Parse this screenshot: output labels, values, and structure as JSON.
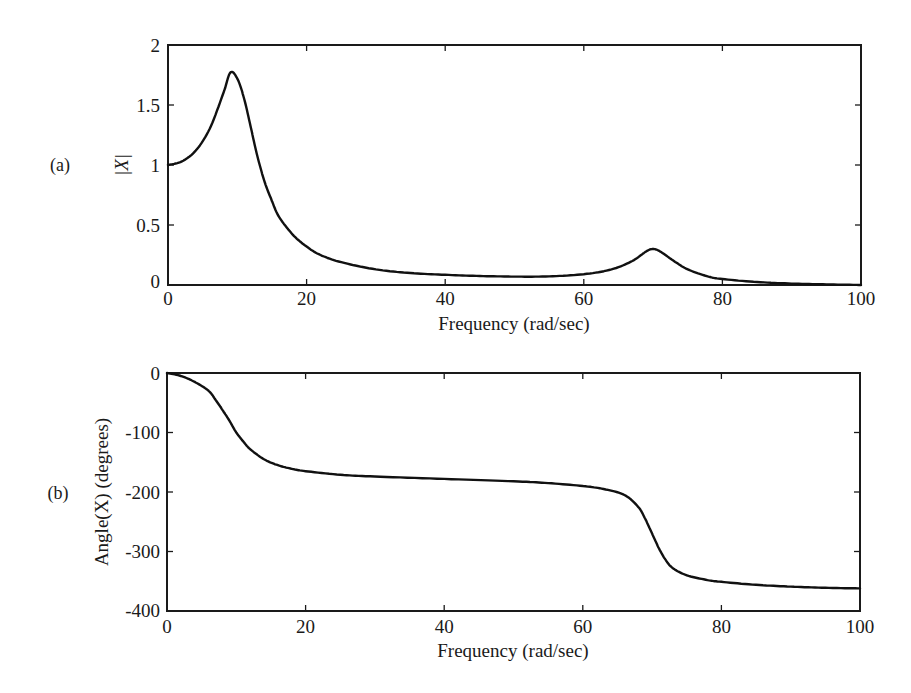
{
  "figure": {
    "panels": [
      {
        "id": "a",
        "panel_label": "(a)",
        "xlabel": "Frequency (rad/sec)",
        "ylabel": "|X|",
        "xticks": [
          "0",
          "20",
          "40",
          "60",
          "80",
          "100"
        ],
        "yticks": [
          "0",
          "0.5",
          "1",
          "1.5",
          "2"
        ]
      },
      {
        "id": "b",
        "panel_label": "(b)",
        "xlabel": "Frequency (rad/sec)",
        "ylabel": "Angle(X) (degrees)",
        "xticks": [
          "0",
          "20",
          "40",
          "60",
          "80",
          "100"
        ],
        "yticks": [
          "0",
          "-100",
          "-200",
          "-300",
          "-400"
        ]
      }
    ],
    "line_color": "#111111"
  },
  "chart_data": [
    {
      "type": "line",
      "title": "",
      "panel": "(a)",
      "xlabel": "Frequency (rad/sec)",
      "ylabel": "|X|",
      "xlim": [
        0,
        100
      ],
      "ylim": [
        0,
        2
      ],
      "xticks": [
        0,
        20,
        40,
        60,
        80,
        100
      ],
      "yticks": [
        0,
        0.5,
        1,
        1.5,
        2
      ],
      "grid": false,
      "legend": null,
      "annotations": [
        "resonance peak ~1.77 at ~9 rad/sec",
        "second resonance peak ~0.3 at ~70 rad/sec"
      ],
      "series": [
        {
          "name": "|X|",
          "x": [
            0,
            2,
            4,
            6,
            8,
            9,
            10,
            11,
            12,
            13,
            14,
            15,
            16,
            18,
            20,
            22,
            25,
            30,
            35,
            40,
            45,
            50,
            55,
            60,
            64,
            67,
            69,
            70,
            71,
            73,
            75,
            78,
            80,
            85,
            90,
            95,
            100
          ],
          "values": [
            1.0,
            1.03,
            1.12,
            1.3,
            1.6,
            1.77,
            1.72,
            1.55,
            1.3,
            1.05,
            0.85,
            0.7,
            0.57,
            0.42,
            0.32,
            0.25,
            0.19,
            0.13,
            0.1,
            0.085,
            0.075,
            0.07,
            0.072,
            0.09,
            0.13,
            0.2,
            0.28,
            0.3,
            0.28,
            0.2,
            0.13,
            0.07,
            0.05,
            0.025,
            0.012,
            0.005,
            0.0
          ]
        }
      ]
    },
    {
      "type": "line",
      "title": "",
      "panel": "(b)",
      "xlabel": "Frequency (rad/sec)",
      "ylabel": "Angle(X) (degrees)",
      "xlim": [
        0,
        100
      ],
      "ylim": [
        -400,
        0
      ],
      "xticks": [
        0,
        20,
        40,
        60,
        80,
        100
      ],
      "yticks": [
        0,
        -100,
        -200,
        -300,
        -400
      ],
      "grid": false,
      "legend": null,
      "series": [
        {
          "name": "Angle(X)",
          "x": [
            0,
            2,
            4,
            6,
            7,
            8,
            9,
            10,
            11,
            12,
            14,
            16,
            18,
            20,
            25,
            30,
            40,
            50,
            55,
            60,
            63,
            66,
            68,
            69,
            70,
            71,
            72,
            73,
            75,
            78,
            80,
            85,
            90,
            95,
            100
          ],
          "values": [
            0,
            -5,
            -15,
            -30,
            -45,
            -62,
            -80,
            -100,
            -115,
            -128,
            -145,
            -155,
            -161,
            -165,
            -171,
            -174,
            -178,
            -182,
            -185,
            -190,
            -195,
            -205,
            -225,
            -245,
            -270,
            -295,
            -315,
            -328,
            -340,
            -348,
            -351,
            -356,
            -359,
            -361,
            -362
          ]
        }
      ]
    }
  ]
}
